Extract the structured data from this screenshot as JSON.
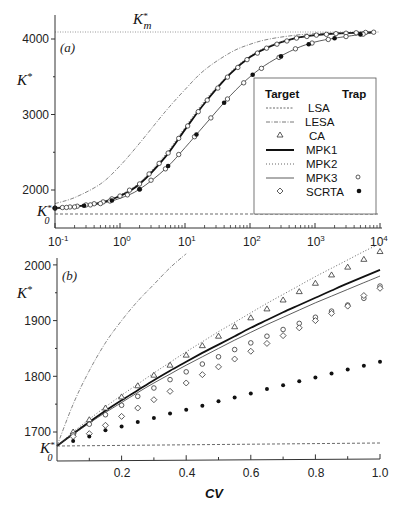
{
  "chart_data": [
    {
      "panel": "(a)",
      "type": "line",
      "xscale": "log",
      "xlabel": "CV",
      "ylabel": "K*",
      "xlim": [
        0.1,
        10000
      ],
      "ylim": [
        1530,
        4200
      ],
      "x_ticks": [
        "10^-1",
        "10^0",
        "10^1",
        "10^2",
        "10^3",
        "10^4"
      ],
      "y_ticks": [
        2000,
        3000,
        4000
      ],
      "annotations": [
        {
          "text": "K*_m",
          "value": 4090,
          "style": "dotted horizontal line"
        },
        {
          "text": "K*_0",
          "value": 1680,
          "style": "dashed horizontal line (LSA)"
        }
      ],
      "x": [
        0.1,
        0.2,
        0.5,
        1,
        2,
        5,
        10,
        20,
        50,
        100,
        200,
        500,
        1000,
        2000,
        5000,
        8000
      ],
      "series": [
        {
          "name": "LSA",
          "style": "dashed",
          "values": [
            1680,
            1680,
            1680,
            1680,
            1680,
            1680,
            1680,
            1680,
            1680,
            1680,
            1680,
            1680,
            1680,
            1680,
            1680,
            1680
          ]
        },
        {
          "name": "LESA",
          "style": "dash-dot",
          "values": [
            1820,
            1900,
            2080,
            2320,
            2620,
            3040,
            3330,
            3590,
            3820,
            3930,
            4000,
            4050,
            4070,
            4080,
            4090,
            4090
          ]
        },
        {
          "name": "MPK1",
          "style": "thick solid",
          "values": [
            1760,
            1780,
            1830,
            1920,
            2080,
            2440,
            2800,
            3150,
            3540,
            3760,
            3900,
            4010,
            4050,
            4070,
            4085,
            4090
          ]
        },
        {
          "name": "MPK2",
          "style": "dotted",
          "values": [
            1760,
            1785,
            1840,
            1935,
            2100,
            2470,
            2830,
            3180,
            3560,
            3775,
            3910,
            4015,
            4055,
            4072,
            4086,
            4090
          ]
        },
        {
          "name": "MPK3",
          "style": "thin solid",
          "values": [
            1760,
            1775,
            1820,
            1890,
            2010,
            2280,
            2560,
            2860,
            3250,
            3500,
            3690,
            3870,
            3960,
            4010,
            4060,
            4080
          ]
        }
      ],
      "markers": [
        {
          "name": "SCRTA (target)",
          "marker": "open diamond",
          "follows": "MPK1"
        },
        {
          "name": "MPK3 (trap)",
          "marker": "small open circle",
          "follows": "MPK3"
        },
        {
          "name": "SCRTA (trap)",
          "marker": "filled circle",
          "follows": "MPK3"
        }
      ],
      "legend": {
        "position": "right, inside",
        "headers": [
          "Target",
          "Trap"
        ],
        "entries": [
          {
            "label": "LSA",
            "target": "dashed line",
            "trap": ""
          },
          {
            "label": "LESA",
            "target": "dash-dot line",
            "trap": ""
          },
          {
            "label": "CA",
            "target": "open triangle",
            "trap": ""
          },
          {
            "label": "MPK1",
            "target": "thick solid line",
            "trap": ""
          },
          {
            "label": "MPK2",
            "target": "dotted line",
            "trap": ""
          },
          {
            "label": "MPK3",
            "target": "thin solid line",
            "trap": "small open circle"
          },
          {
            "label": "SCRTA",
            "target": "open diamond",
            "trap": "filled circle"
          }
        ]
      }
    },
    {
      "panel": "(b)",
      "type": "line",
      "xscale": "linear",
      "xlabel": "CV",
      "ylabel": "K*",
      "xlim": [
        0,
        1.0
      ],
      "ylim": [
        1650,
        2000
      ],
      "x_ticks": [
        0.2,
        0.4,
        0.6,
        0.8,
        1.0
      ],
      "y_ticks": [
        1700,
        1800,
        1900,
        2000
      ],
      "annotations": [
        {
          "text": "K*_0",
          "value": 1675
        }
      ],
      "x": [
        0,
        0.05,
        0.1,
        0.15,
        0.2,
        0.25,
        0.3,
        0.35,
        0.4,
        0.45,
        0.5,
        0.55,
        0.6,
        0.65,
        0.7,
        0.75,
        0.8,
        0.85,
        0.9,
        0.95,
        1.0
      ],
      "series": [
        {
          "name": "LSA",
          "style": "dashed",
          "values": [
            1675,
            1675,
            1675,
            1675,
            1675,
            1675,
            1675,
            1675,
            1675,
            1676,
            1676,
            1676,
            1676,
            1676,
            1677,
            1677,
            1677,
            1677,
            1677,
            1678,
            1678
          ]
        },
        {
          "name": "LESA",
          "style": "dash-dot",
          "values": [
            1675,
            1750,
            1810,
            1860,
            1900,
            1935,
            1965,
            1995,
            2020,
            null,
            null,
            null,
            null,
            null,
            null,
            null,
            null,
            null,
            null,
            null,
            null
          ]
        },
        {
          "name": "MPK1",
          "style": "thick solid",
          "values": [
            1675,
            1697,
            1718,
            1738,
            1757,
            1775,
            1793,
            1810,
            1826,
            1842,
            1857,
            1872,
            1887,
            1901,
            1915,
            1928,
            1941,
            1954,
            1967,
            1979,
            1991
          ]
        },
        {
          "name": "MPK2",
          "style": "dotted",
          "values": [
            1675,
            1700,
            1723,
            1745,
            1766,
            1786,
            1806,
            1825,
            1844,
            1862,
            1880,
            1897,
            1914,
            1931,
            1947,
            1963,
            1979,
            1994,
            2009,
            2024,
            2038
          ]
        },
        {
          "name": "MPK3",
          "style": "thin solid",
          "values": [
            1675,
            1696,
            1716,
            1735,
            1753,
            1771,
            1788,
            1804,
            1820,
            1835,
            1850,
            1865,
            1879,
            1893,
            1906,
            1919,
            1932,
            1944,
            1956,
            1968,
            1980
          ]
        }
      ],
      "markers": [
        {
          "name": "CA (target)",
          "marker": "open triangle",
          "x": [
            0.05,
            0.1,
            0.15,
            0.2,
            0.25,
            0.3,
            0.35,
            0.4,
            0.45,
            0.5,
            0.55,
            0.6,
            0.65,
            0.7,
            0.75,
            0.8,
            0.85,
            0.9,
            0.95,
            1.0
          ],
          "values": [
            1700,
            1722,
            1743,
            1763,
            1783,
            1802,
            1820,
            1838,
            1855,
            1872,
            1889,
            1905,
            1921,
            1937,
            1952,
            1967,
            1982,
            1996,
            2010,
            2024
          ]
        },
        {
          "name": "MPK3 (trap)",
          "marker": "small open circle",
          "x": [
            0.05,
            0.1,
            0.15,
            0.2,
            0.25,
            0.3,
            0.35,
            0.4,
            0.45,
            0.5,
            0.55,
            0.6,
            0.65,
            0.7,
            0.75,
            0.8,
            0.85,
            0.9,
            0.95,
            1.0
          ],
          "values": [
            1695,
            1714,
            1731,
            1748,
            1764,
            1779,
            1794,
            1808,
            1822,
            1835,
            1848,
            1860,
            1872,
            1884,
            1895,
            1906,
            1917,
            1928,
            1940,
            1962
          ]
        },
        {
          "name": "SCRTA (target)",
          "marker": "open diamond",
          "x": [
            0.05,
            0.1,
            0.15,
            0.2,
            0.25,
            0.3,
            0.35,
            0.4,
            0.45,
            0.5,
            0.55,
            0.6,
            0.65,
            0.7,
            0.75,
            0.8,
            0.85,
            0.9,
            0.95,
            1.0
          ],
          "values": [
            1692,
            1697,
            1712,
            1728,
            1743,
            1758,
            1773,
            1788,
            1803,
            1817,
            1831,
            1845,
            1859,
            1873,
            1887,
            1900,
            1913,
            1926,
            1945,
            1958
          ]
        },
        {
          "name": "SCRTA (trap)",
          "marker": "filled circle",
          "x": [
            0.05,
            0.1,
            0.15,
            0.2,
            0.25,
            0.3,
            0.35,
            0.4,
            0.45,
            0.5,
            0.55,
            0.6,
            0.65,
            0.7,
            0.75,
            0.8,
            0.85,
            0.9,
            0.95,
            1.0
          ],
          "values": [
            1684,
            1692,
            1703,
            1710,
            1718,
            1725,
            1733,
            1740,
            1747,
            1755,
            1762,
            1769,
            1777,
            1784,
            1791,
            1798,
            1805,
            1812,
            1819,
            1826
          ]
        }
      ]
    }
  ],
  "labels": {
    "panel_a": "(a)",
    "panel_b": "(b)",
    "ylabel_a": "K",
    "ylabel_b": "K",
    "k_sup": "*",
    "km_label": "K",
    "km_sub": "m",
    "k0_label": "K",
    "k0_sub": "0",
    "xlabel": "CV",
    "a_yticks": [
      "4000",
      "3000",
      "2000"
    ],
    "a_xticks": [
      "10",
      "10",
      "10",
      "10",
      "10",
      "10"
    ],
    "a_xtick_exps": [
      "-1",
      "0",
      "1",
      "2",
      "3",
      "4"
    ],
    "b_yticks": [
      "2000",
      "1900",
      "1800",
      "1700"
    ],
    "b_xticks": [
      "0.2",
      "0.4",
      "0.6",
      "0.8",
      "1.0"
    ],
    "legend_header_target": "Target",
    "legend_header_trap": "Trap",
    "legend_entries": [
      "LSA",
      "LESA",
      "CA",
      "MPK1",
      "MPK2",
      "MPK3",
      "SCRTA"
    ]
  }
}
